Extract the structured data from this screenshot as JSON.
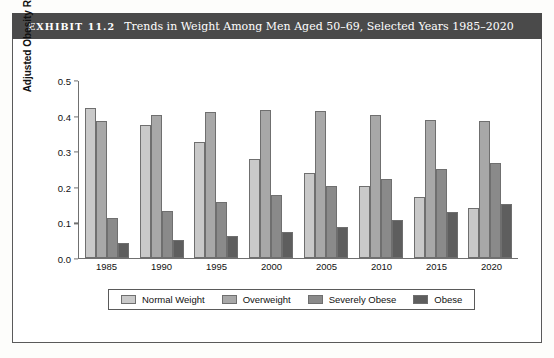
{
  "header": {
    "exhibit_label": "EXHIBIT 11.2",
    "title": "Trends in Weight Among Men Aged 50–69, Selected Years 1985–2020"
  },
  "chart_data": {
    "type": "bar",
    "title": "Trends in Weight Among Men Aged 50–69, Selected Years 1985–2020",
    "xlabel": "",
    "ylabel": "Adjusted Obesity Rate",
    "categories": [
      "1985",
      "1990",
      "1995",
      "2000",
      "2005",
      "2010",
      "2015",
      "2020"
    ],
    "series": [
      {
        "name": "Normal Weight",
        "color": "#c9c9c9",
        "values": [
          0.42,
          0.372,
          0.325,
          0.278,
          0.238,
          0.202,
          0.17,
          0.14
        ]
      },
      {
        "name": "Overweight",
        "color": "#a8a8a8",
        "values": [
          0.385,
          0.4,
          0.41,
          0.415,
          0.412,
          0.4,
          0.386,
          0.385
        ]
      },
      {
        "name": "Severely Obese",
        "color": "#8a8a8a",
        "values": [
          0.112,
          0.13,
          0.155,
          0.175,
          0.2,
          0.222,
          0.248,
          0.265
        ]
      },
      {
        "name": "Obese",
        "color": "#5e5e5e",
        "values": [
          0.04,
          0.05,
          0.06,
          0.073,
          0.086,
          0.105,
          0.128,
          0.152
        ]
      }
    ],
    "ylim": [
      0.0,
      0.5
    ],
    "yticks": [
      "0.0",
      "0.1",
      "0.2",
      "0.3",
      "0.4",
      "0.5"
    ],
    "ytick_values": [
      0.0,
      0.1,
      0.2,
      0.3,
      0.4,
      0.5
    ],
    "grid": false,
    "legend_position": "bottom"
  }
}
